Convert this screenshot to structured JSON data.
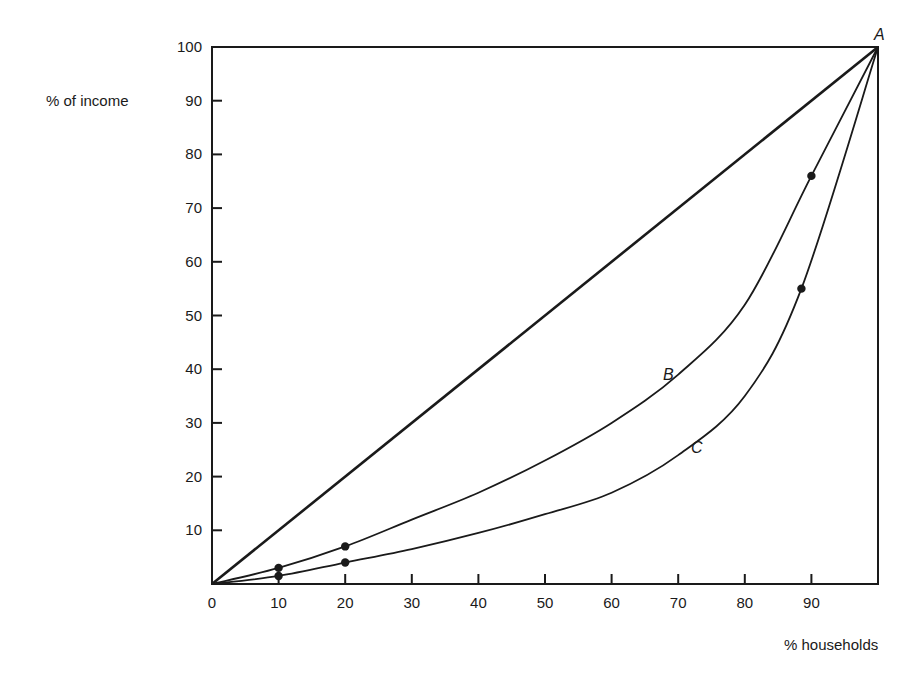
{
  "chart_data": {
    "type": "line",
    "title": "",
    "xlabel": "% households",
    "ylabel": "% of income",
    "xlim": [
      0,
      100
    ],
    "ylim": [
      0,
      100
    ],
    "grid": false,
    "legend": "none (curves labeled inline A, B, C)",
    "x_ticks": [
      "0",
      "10",
      "20",
      "30",
      "40",
      "50",
      "60",
      "70",
      "80",
      "90"
    ],
    "y_ticks": [
      "10",
      "20",
      "30",
      "40",
      "50",
      "60",
      "70",
      "80",
      "90",
      "100"
    ],
    "series": [
      {
        "name": "Line of equality (0 to A)",
        "label": "A",
        "x": [
          0,
          100
        ],
        "y": [
          0,
          100
        ],
        "markers": []
      },
      {
        "name": "Lorenz curve B",
        "label": "B",
        "x": [
          0,
          10,
          20,
          30,
          40,
          50,
          60,
          70,
          80,
          90,
          100
        ],
        "y": [
          0,
          3,
          7,
          12,
          17,
          23,
          30,
          39,
          52,
          76,
          100
        ],
        "markers": [
          [
            10,
            3
          ],
          [
            20,
            7
          ],
          [
            90,
            76
          ]
        ]
      },
      {
        "name": "Lorenz curve C",
        "label": "C",
        "x": [
          0,
          10,
          20,
          30,
          40,
          50,
          60,
          70,
          80,
          88.5,
          100
        ],
        "y": [
          0,
          1.5,
          4,
          6.5,
          9.5,
          13,
          17,
          24,
          35,
          55,
          100
        ],
        "markers": [
          [
            10,
            1.5
          ],
          [
            20,
            4
          ],
          [
            88.5,
            55
          ]
        ]
      }
    ],
    "annotations": [
      {
        "text": "A",
        "x": 100,
        "y": 100
      },
      {
        "text": "B",
        "x": 68,
        "y": 39
      },
      {
        "text": "C",
        "x": 72.5,
        "y": 25
      }
    ]
  },
  "labels": {
    "y_axis_title": "% of income",
    "x_axis_title": "% households",
    "point_a": "A",
    "curve_b": "B",
    "curve_c": "C"
  }
}
